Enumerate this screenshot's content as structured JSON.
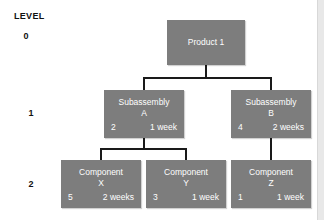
{
  "diagram": {
    "type": "product-structure-tree",
    "legend_label": "LEVEL",
    "levels": [
      {
        "number": "0"
      },
      {
        "number": "1"
      },
      {
        "number": "2"
      }
    ],
    "colors": {
      "node_fill": "#7d7d7d",
      "node_text": "#ffffff",
      "line": "#1a1a1a",
      "background": "#ffffff",
      "edge_strip": "#e8e8e8"
    },
    "nodes": {
      "product": {
        "title": "Product 1",
        "sub": "",
        "quantity": "",
        "lead_time": ""
      },
      "subassembly_a": {
        "title": "Subassembly",
        "sub": "A",
        "quantity": "2",
        "lead_time": "1 week"
      },
      "subassembly_b": {
        "title": "Subassembly",
        "sub": "B",
        "quantity": "4",
        "lead_time": "2 weeks"
      },
      "component_x": {
        "title": "Component",
        "sub": "X",
        "quantity": "5",
        "lead_time": "2 weeks"
      },
      "component_y": {
        "title": "Component",
        "sub": "Y",
        "quantity": "3",
        "lead_time": "1 week"
      },
      "component_z": {
        "title": "Component",
        "sub": "Z",
        "quantity": "1",
        "lead_time": "1 week"
      }
    }
  }
}
